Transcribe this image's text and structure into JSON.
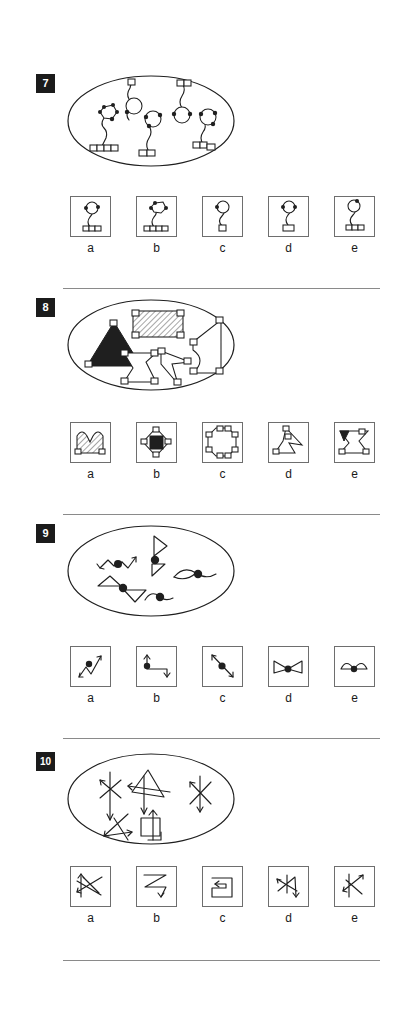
{
  "document": {
    "type": "visual-analogy-test-page",
    "page_background": "#ffffff",
    "ink_color": "#1f1f1f",
    "badge_background": "#1b1b1b",
    "badge_text_color": "#ffffff",
    "rule_color": "#8a8a8a",
    "option_border_color": "#6e6e6e"
  },
  "puzzles": [
    {
      "number": "7",
      "stem_container": "oval",
      "stem_description": "Five line figures inside an ellipse: each has a small circle or polygon head with dots, a wavy stem, and a row of small squares or a single square at the base",
      "options": [
        {
          "label": "a",
          "figure": "circle-head-with-two-dots, wavy stem, three-square base"
        },
        {
          "label": "b",
          "figure": "polygon-head-with-three-dots, wavy stem, four-square base"
        },
        {
          "label": "c",
          "figure": "circle-head-with-one-dot, wavy stem, single-square base"
        },
        {
          "label": "d",
          "figure": "circle-head-with-two-dots, wavy stem, single wide square base"
        },
        {
          "label": "e",
          "figure": "circle-head-with-one-dot, wavy stem, three-square base"
        }
      ]
    },
    {
      "number": "8",
      "stem_container": "oval",
      "stem_description": "Five polygons inside an ellipse: a solid black triangle, a hatched rectangle, and three white concave polygons, each with small dotted squares at the corners",
      "options": [
        {
          "label": "a",
          "figure": "hatched double-arch shape with two corner squares"
        },
        {
          "label": "b",
          "figure": "white diamond containing a solid black square, corner squares"
        },
        {
          "label": "c",
          "figure": "white octagon with corner squares around the rim"
        },
        {
          "label": "d",
          "figure": "white arrow-like triangle pair with corner squares"
        },
        {
          "label": "e",
          "figure": "white bowtie / concave polygon with a black triangle and corner squares"
        }
      ]
    },
    {
      "number": "9",
      "stem_container": "oval",
      "stem_description": "Five line figures inside an ellipse, each a pair of strokes joined at a large filled dot: zigzag arrows, triangles, and curved S-shapes",
      "options": [
        {
          "label": "a",
          "figure": "zigzag line with arrowheads and a central filled dot"
        },
        {
          "label": "b",
          "figure": "right-angle line with up and down arrows and a filled dot"
        },
        {
          "label": "c",
          "figure": "straight diagonal line with arrowheads and a central filled dot"
        },
        {
          "label": "d",
          "figure": "two triangles meeting at a central filled dot (bowtie)"
        },
        {
          "label": "e",
          "figure": "two half-ellipse curves meeting at a central filled dot"
        }
      ]
    },
    {
      "number": "10",
      "stem_container": "oval",
      "stem_description": "Six arrow-line figures inside an ellipse: overlapping zigzag arrows, triangles and one square with an up arrow",
      "options": [
        {
          "label": "a",
          "figure": "tangled zigzag arrows crossing in a square"
        },
        {
          "label": "b",
          "figure": "Z-shaped zigzag with down arrow"
        },
        {
          "label": "c",
          "figure": "rectangular spiral with left arrow"
        },
        {
          "label": "d",
          "figure": "crossed arrows with down arrow"
        },
        {
          "label": "e",
          "figure": "lightning-bolt zigzag with two arrowheads"
        }
      ]
    }
  ],
  "option_labels": [
    "a",
    "b",
    "c",
    "d",
    "e"
  ]
}
